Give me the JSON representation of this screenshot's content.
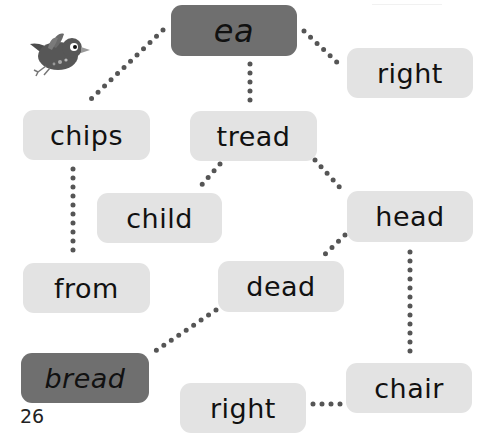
{
  "page": {
    "page_number": "26",
    "colors": {
      "box_light": "#e3e3e3",
      "box_dark": "#6f6f6f",
      "dots": "#555555",
      "text": "#111111"
    }
  },
  "illustration": {
    "name": "bird"
  },
  "words": [
    {
      "id": "ea",
      "label": "ea",
      "style": "dark"
    },
    {
      "id": "right_top",
      "label": "right",
      "style": "light"
    },
    {
      "id": "chips",
      "label": "chips",
      "style": "light"
    },
    {
      "id": "tread",
      "label": "tread",
      "style": "light"
    },
    {
      "id": "child",
      "label": "child",
      "style": "light"
    },
    {
      "id": "head",
      "label": "head",
      "style": "light"
    },
    {
      "id": "from",
      "label": "from",
      "style": "light"
    },
    {
      "id": "dead",
      "label": "dead",
      "style": "light"
    },
    {
      "id": "bread",
      "label": "bread",
      "style": "dark"
    },
    {
      "id": "right_bottom",
      "label": "right",
      "style": "light"
    },
    {
      "id": "chair",
      "label": "chair",
      "style": "light"
    }
  ],
  "connections": [
    [
      "ea",
      "chips"
    ],
    [
      "ea",
      "tread"
    ],
    [
      "ea",
      "right_top"
    ],
    [
      "chips",
      "from"
    ],
    [
      "tread",
      "child"
    ],
    [
      "tread",
      "head"
    ],
    [
      "head",
      "dead"
    ],
    [
      "head",
      "chair"
    ],
    [
      "dead",
      "bread"
    ],
    [
      "chair",
      "right_bottom"
    ]
  ]
}
